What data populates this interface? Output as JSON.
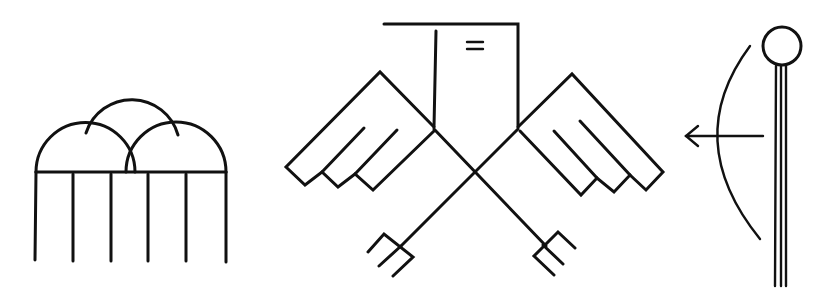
{
  "figure": {
    "background": "#ffffff",
    "stroke_color": "#111111",
    "symbols": [
      {
        "id": "arches",
        "description": "Three overlapping semicircular domes on a horizontal beam supported by six vertical posts",
        "post_count": 6,
        "dome_count": 3
      },
      {
        "id": "bird",
        "description": "Stylized thunderbird with rectangular head, '=' mark, stepped feathered wings, crossed legs ending in three-pronged talons",
        "head_mark": "="
      },
      {
        "id": "staff-and-bow",
        "description": "Staff with circle top and triple shaft beside a curved bow with a leftward arrow"
      }
    ]
  }
}
